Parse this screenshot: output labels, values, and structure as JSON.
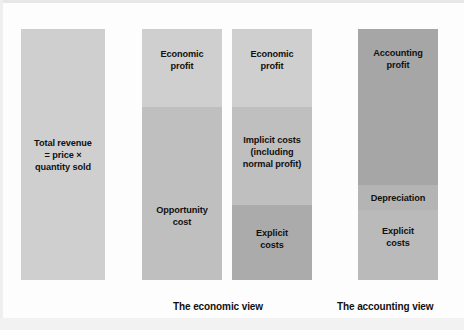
{
  "figure": {
    "background_color": "#fdfdfd",
    "text_color": "#111111"
  },
  "colors": {
    "light_gray": "#cfcfcf",
    "medium_gray": "#bfbfbf",
    "dark_gray": "#ababab",
    "darker_gray": "#a6a6a6"
  },
  "columns": [
    {
      "id": "total-revenue",
      "name": "total-revenue-column",
      "x": 21,
      "y": 29,
      "width": 84,
      "height": 251,
      "segments": [
        {
          "id": "total-revenue",
          "name": "total-revenue-segment",
          "label": "Total revenue\n= price ×\nquantity sold",
          "top": 0,
          "height": 251,
          "color": "#cfcfcf",
          "label_offset": 0
        }
      ]
    },
    {
      "id": "economic-opportunity",
      "name": "economic-opportunity-column",
      "x": 142,
      "y": 29,
      "width": 80,
      "height": 251,
      "segments": [
        {
          "id": "economic-profit",
          "name": "economic-profit-segment",
          "label": "Economic\nprofit",
          "top": 0,
          "height": 78,
          "color": "#cfcfcf",
          "label_offset": -8
        },
        {
          "id": "opportunity-cost",
          "name": "opportunity-cost-segment",
          "label": "Opportunity\ncost",
          "top": 78,
          "height": 173,
          "color": "#bfbfbf",
          "label_offset": 22
        }
      ]
    },
    {
      "id": "economic-breakdown",
      "name": "economic-breakdown-column",
      "x": 232,
      "y": 29,
      "width": 80,
      "height": 251,
      "segments": [
        {
          "id": "economic-profit-2",
          "name": "economic-profit-segment",
          "label": "Economic\nprofit",
          "top": 0,
          "height": 78,
          "color": "#cfcfcf",
          "label_offset": -8
        },
        {
          "id": "implicit-costs",
          "name": "implicit-costs-segment",
          "label": "Implicit costs\n(including\nnormal profit)",
          "top": 78,
          "height": 98,
          "color": "#bfbfbf",
          "label_offset": -4
        },
        {
          "id": "explicit-costs-economic",
          "name": "explicit-costs-segment",
          "label": "Explicit\ncosts",
          "top": 176,
          "height": 75,
          "color": "#ababab",
          "label_offset": -4
        }
      ]
    },
    {
      "id": "accounting",
      "name": "accounting-column",
      "x": 358,
      "y": 29,
      "width": 80,
      "height": 251,
      "segments": [
        {
          "id": "accounting-profit",
          "name": "accounting-profit-segment",
          "label": "Accounting\nprofit",
          "top": 0,
          "height": 156,
          "color": "#a6a6a6",
          "label_offset": -48
        },
        {
          "id": "depreciation",
          "name": "depreciation-segment",
          "label": "Depreciation",
          "top": 156,
          "height": 25,
          "color": "#b4b4b4",
          "label_offset": 0
        },
        {
          "id": "explicit-costs-accounting",
          "name": "explicit-costs-segment",
          "label": "Explicit\ncosts",
          "top": 181,
          "height": 70,
          "color": "#bababa",
          "label_offset": -8
        }
      ]
    }
  ],
  "captions": [
    {
      "id": "economic-view",
      "name": "economic-view-caption",
      "text": "The economic view",
      "x": 173,
      "y": 300
    },
    {
      "id": "accounting-view",
      "name": "accounting-view-caption",
      "text": "The accounting view",
      "x": 337,
      "y": 300
    }
  ]
}
